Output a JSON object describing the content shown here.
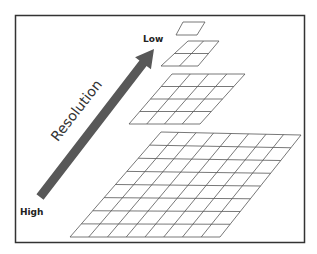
{
  "diagram": {
    "labels": {
      "low": "Low",
      "high": "High",
      "axis": "Resolution"
    },
    "colors": {
      "frame": "#333333",
      "arrow": "#585858",
      "grid_line": "#555555",
      "background": "#ffffff"
    },
    "levels": [
      {
        "name": "level-1x1",
        "rows": 1,
        "cols": 1,
        "corners": [
          [
            183,
            22
          ],
          [
            205,
            22
          ],
          [
            197,
            35
          ],
          [
            176,
            35
          ]
        ]
      },
      {
        "name": "level-2x2",
        "rows": 2,
        "cols": 2,
        "corners": [
          [
            188,
            41
          ],
          [
            219,
            41
          ],
          [
            198,
            66
          ],
          [
            161,
            66
          ]
        ]
      },
      {
        "name": "level-4x4",
        "rows": 4,
        "cols": 4,
        "corners": [
          [
            172,
            74
          ],
          [
            245,
            74
          ],
          [
            200,
            124
          ],
          [
            129,
            124
          ]
        ]
      },
      {
        "name": "level-8x8",
        "rows": 8,
        "cols": 8,
        "corners": [
          [
            161,
            132
          ],
          [
            301,
            135
          ],
          [
            220,
            237
          ],
          [
            70,
            237
          ]
        ]
      }
    ],
    "arrow": {
      "tail": [
        40,
        197
      ],
      "head": [
        154,
        49
      ]
    }
  }
}
